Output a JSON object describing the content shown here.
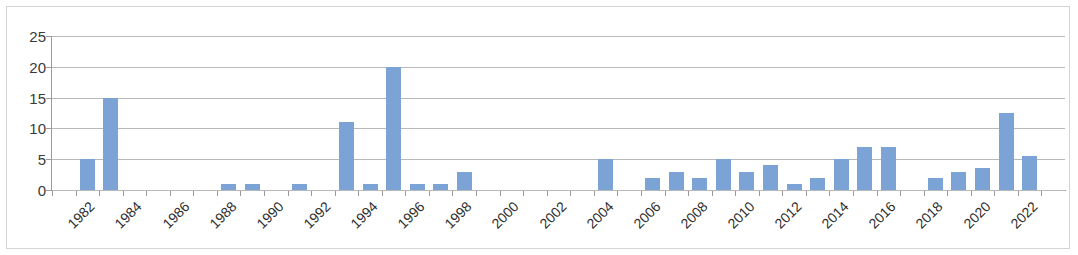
{
  "chart_data": {
    "type": "bar",
    "title": "",
    "subtitle": "",
    "xlabel": "",
    "ylabel": "",
    "ylim": [
      0,
      25
    ],
    "yticks": [
      0,
      5,
      10,
      15,
      20,
      25
    ],
    "ytick_labels": [
      "0",
      "5",
      "10",
      "15",
      "20",
      "25"
    ],
    "grid": true,
    "legend": false,
    "legend_position": "none",
    "xtick_rotation": -45,
    "xtick_labels": [
      "1982",
      "1984",
      "1986",
      "1988",
      "1990",
      "1992",
      "1994",
      "1996",
      "1998",
      "2000",
      "2002",
      "2004",
      "2006",
      "2008",
      "2010",
      "2012",
      "2014",
      "2016",
      "2018",
      "2020",
      "2022"
    ],
    "bar_color": "#7ba3d6",
    "gridline_color": "#b8b8b8",
    "axis_color": "#9a9a9a",
    "categories": [
      "1981",
      "1982",
      "1983",
      "1984",
      "1985",
      "1986",
      "1987",
      "1988",
      "1989",
      "1990",
      "1991",
      "1992",
      "1993",
      "1994",
      "1995",
      "1996",
      "1997",
      "1998",
      "1999",
      "2000",
      "2001",
      "2002",
      "2003",
      "2004",
      "2005",
      "2006",
      "2007",
      "2008",
      "2009",
      "2010",
      "2011",
      "2012",
      "2013",
      "2014",
      "2015",
      "2016",
      "2017",
      "2018",
      "2019",
      "2020",
      "2021",
      "2022",
      "2023"
    ],
    "values": [
      0,
      5,
      15,
      0,
      0,
      0,
      0,
      1,
      1,
      0,
      1,
      0,
      11,
      1,
      20,
      1,
      1,
      3,
      0,
      0,
      0,
      0,
      0,
      5,
      0,
      2,
      3,
      2,
      5,
      3,
      4,
      1,
      2,
      5,
      7,
      7,
      0,
      2,
      3,
      3.5,
      12.5,
      5.5,
      0
    ]
  }
}
